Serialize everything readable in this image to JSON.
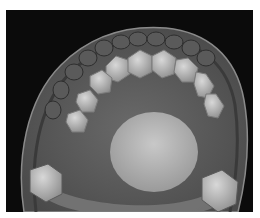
{
  "image": {
    "subject": "dental-arch-3d-scan",
    "view": "occlusal",
    "palette": {
      "background": "#0b0b0b",
      "gum": "#5e5e5e",
      "gum_edge": "#8a8a8a",
      "tooth": "#c4c4c4",
      "tooth_shadow": "#8c8c8c",
      "palate": "#bdbdbd",
      "border": "#ffffff"
    }
  }
}
